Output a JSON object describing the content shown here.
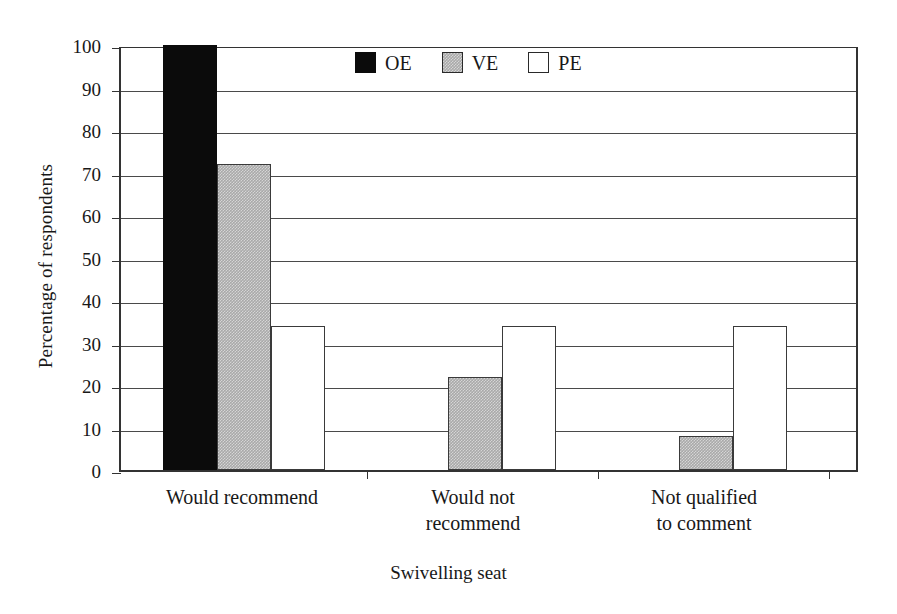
{
  "chart_data": {
    "type": "bar",
    "title": "",
    "xlabel": "Swivelling seat",
    "ylabel": "Percentage of respondents",
    "categories": [
      "Would recommend",
      "Would not recommend",
      "Not qualified to comment"
    ],
    "series": [
      {
        "name": "OE",
        "values": [
          100,
          0,
          0
        ],
        "color": "#0b0b0b"
      },
      {
        "name": "VE",
        "values": [
          72,
          22,
          8
        ],
        "color": "#a9a9a9"
      },
      {
        "name": "PE",
        "values": [
          34,
          34,
          34
        ],
        "color": "#ffffff"
      }
    ],
    "ylim": [
      0,
      100
    ],
    "ytick_step": 10,
    "yticks": [
      "0",
      "10",
      "20",
      "30",
      "40",
      "50",
      "60",
      "70",
      "80",
      "90",
      "100"
    ],
    "grid": "horizontal",
    "legend_position": "top-center"
  },
  "axes": {
    "y_title": "Percentage of respondents",
    "x_title": "Swivelling seat"
  },
  "legend": {
    "items": [
      {
        "label": "OE",
        "swatch": "filled-black-square"
      },
      {
        "label": "VE",
        "swatch": "hatched-gray-square"
      },
      {
        "label": "PE",
        "swatch": "outlined-white-square"
      }
    ]
  },
  "x_categories": [
    {
      "line1": "Would recommend",
      "line2": ""
    },
    {
      "line1": "Would not",
      "line2": "recommend"
    },
    {
      "line1": "Not qualified",
      "line2": "to comment"
    }
  ]
}
